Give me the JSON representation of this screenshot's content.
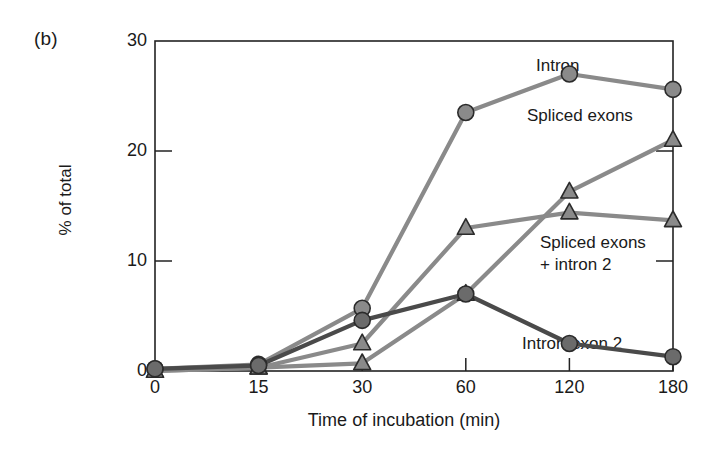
{
  "panel": {
    "letter": "(b)"
  },
  "chart_data": {
    "type": "line",
    "title": "",
    "xlabel": "Time of incubation (min)",
    "ylabel": "% of total",
    "x": [
      0,
      15,
      30,
      60,
      120,
      180
    ],
    "xtick_labels": [
      "0",
      "15",
      "30",
      "60",
      "120",
      "180"
    ],
    "ytick_labels": [
      "0",
      "10",
      "20",
      "30"
    ],
    "yticks": [
      0,
      10,
      20,
      30
    ],
    "xlim": [
      0,
      180
    ],
    "ylim": [
      0,
      30
    ],
    "grid": false,
    "legend_position": "inline-annotations",
    "series": [
      {
        "name": "Intron",
        "marker": "circle",
        "color": "#8a8a8a",
        "line_color": "#8a8a8a",
        "x": [
          0,
          15,
          30,
          60,
          120,
          180
        ],
        "values": [
          0.2,
          0.6,
          5.7,
          23.5,
          27.0,
          25.6
        ]
      },
      {
        "name": "Spliced exons",
        "marker": "triangle",
        "color": "#8a8a8a",
        "line_color": "#8a8a8a",
        "x": [
          0,
          15,
          30,
          60,
          120,
          180
        ],
        "values": [
          0.0,
          0.3,
          0.7,
          7.0,
          16.3,
          21.0
        ]
      },
      {
        "name": "Spliced exons\n+ intron 2",
        "marker": "triangle",
        "color": "#8a8a8a",
        "line_color": "#8a8a8a",
        "x": [
          0,
          15,
          30,
          60,
          120,
          180
        ],
        "values": [
          0.0,
          0.3,
          2.5,
          13.0,
          14.4,
          13.7
        ]
      },
      {
        "name": "Intron-exon 2",
        "marker": "circle",
        "color": "#6b6b6b",
        "line_color": "#4a4a4a",
        "x": [
          0,
          15,
          30,
          60,
          120,
          180
        ],
        "values": [
          0.2,
          0.5,
          4.6,
          7.0,
          2.5,
          1.3
        ]
      }
    ],
    "annotations": [
      {
        "text": "Intron",
        "x_px": 536,
        "y_px": 55
      },
      {
        "text": "Spliced exons",
        "x_px": 527,
        "y_px": 105
      },
      {
        "text": "Spliced exons\n+ intron 2",
        "x_px": 540,
        "y_px": 232
      },
      {
        "text": "Intron-exon 2",
        "x_px": 522,
        "y_px": 333
      }
    ]
  }
}
